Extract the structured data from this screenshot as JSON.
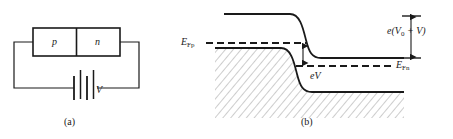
{
  "figure": {
    "ink_color": "#1a1a1a",
    "background": "#ffffff"
  },
  "panel_a": {
    "caption": "(a)",
    "p_region_label": "p",
    "n_region_label": "n",
    "battery_label": "V",
    "description": "p-n junction block connected to a battery in a closed loop circuit"
  },
  "panel_b": {
    "caption": "(b)",
    "fermi_p_label": "E",
    "fermi_p_sub": "Fp",
    "fermi_n_label": "E",
    "fermi_n_sub": "Fn",
    "barrier_label_prefix": "e(V",
    "barrier_label_sub": "0",
    "barrier_label_suffix": " + V)",
    "bias_label": "eV",
    "description": "Energy band diagram of forward-biased junction showing conduction band, valence band, split quasi-Fermi levels, barrier e(V0 + V) and bias offset eV"
  }
}
